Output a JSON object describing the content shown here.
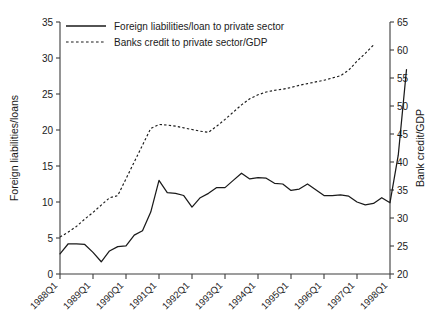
{
  "chart_data": {
    "type": "line",
    "title": "",
    "xlabel": "",
    "ylabel": "Foreign liabilities/loans",
    "y2label": "Bank credit/GDP",
    "ylim": [
      0,
      35
    ],
    "y2lim": [
      20,
      65
    ],
    "yticks": [
      0,
      5,
      10,
      15,
      20,
      25,
      30,
      35
    ],
    "y2ticks": [
      20,
      25,
      30,
      35,
      40,
      45,
      50,
      55,
      60,
      65
    ],
    "grid": false,
    "legend_position": "top-left-inside",
    "xtick_labels": [
      "1988Q1",
      "1989Q1",
      "1990Q1",
      "1991Q1",
      "1992Q1",
      "1993Q1",
      "1994Q1",
      "1995Q1",
      "1996Q1",
      "1997Q1",
      "1998Q1"
    ],
    "xtick_rotation": -45,
    "x": [
      "1988Q1",
      "1988Q2",
      "1988Q3",
      "1988Q4",
      "1989Q1",
      "1989Q2",
      "1989Q3",
      "1989Q4",
      "1990Q1",
      "1990Q2",
      "1990Q3",
      "1990Q4",
      "1991Q1",
      "1991Q2",
      "1991Q3",
      "1991Q4",
      "1992Q1",
      "1992Q2",
      "1992Q3",
      "1992Q4",
      "1993Q1",
      "1993Q2",
      "1993Q3",
      "1993Q4",
      "1994Q1",
      "1994Q2",
      "1994Q3",
      "1994Q4",
      "1995Q1",
      "1995Q2",
      "1995Q3",
      "1995Q4",
      "1996Q1",
      "1996Q2",
      "1996Q3",
      "1996Q4",
      "1997Q1",
      "1997Q2",
      "1997Q3",
      "1997Q4",
      "1998Q1"
    ],
    "series": [
      {
        "name": "Foreign liabilities/loan to private sector",
        "axis": "left",
        "style": "solid",
        "color": "#1a1a1a",
        "values": [
          2.8,
          4.2,
          4.2,
          4.1,
          3.0,
          1.7,
          3.2,
          3.8,
          3.9,
          5.4,
          6.0,
          8.6,
          13.0,
          11.3,
          11.2,
          10.9,
          9.3,
          10.6,
          11.2,
          12.0,
          12.0,
          13.0,
          14.0,
          13.2,
          13.4,
          13.3,
          12.6,
          12.5,
          11.6,
          11.8,
          12.5,
          11.7,
          10.9,
          10.9,
          11.0,
          10.8,
          10.0,
          9.6,
          9.8,
          10.6,
          9.9
        ]
      },
      {
        "name": "Banks credit to private sector/GDP",
        "axis": "right",
        "style": "dashed",
        "color": "#1a1a1a",
        "values": [
          26.6,
          27.5,
          28.5,
          29.8,
          31.0,
          32.3,
          33.6,
          34.0,
          37.0,
          40.0,
          43.0,
          46.0,
          46.7,
          46.6,
          46.4,
          46.1,
          45.8,
          45.5,
          45.3,
          46.4,
          47.6,
          48.9,
          50.2,
          51.3,
          52.0,
          52.5,
          52.8,
          53.0,
          53.3,
          53.7,
          54.0,
          54.3,
          54.6,
          55.0,
          55.4,
          56.4,
          58.0,
          59.4,
          60.9,
          null,
          null
        ]
      }
    ],
    "solid_tail": {
      "note": "solid series continues steeply after 1997Q4",
      "values": [
        9.9,
        16.5,
        28.4
      ]
    }
  },
  "legend": {
    "items": [
      {
        "label": "Foreign liabilities/loan to private sector",
        "style": "solid"
      },
      {
        "label": "Banks credit to private sector/GDP",
        "style": "dashed"
      }
    ]
  },
  "axes": {
    "left_title": "Foreign liabilities/loans",
    "right_title": "Bank credit/GDP"
  }
}
